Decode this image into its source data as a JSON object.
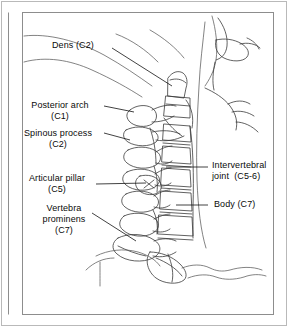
{
  "figure": {
    "background_color": "#ffffff",
    "line_color": "#3a3a3a",
    "frame_color": "#8d8d8d",
    "text_color": "#0a0a0a"
  },
  "labels": {
    "dens": "Dens (C2)",
    "posterior_arch_line1": "Posterior arch",
    "posterior_arch_line2": "(C1)",
    "spinous_process_line1": "Spinous process",
    "spinous_process_line2": "(C2)",
    "articular_pillar_line1": "Articular pillar",
    "articular_pillar_line2": "(C5)",
    "vertebra_prominens_line1": "Vertebra",
    "vertebra_prominens_line2": "prominens",
    "vertebra_prominens_line3": "(C7)",
    "intervertebral_joint_line1": "Intervertebral",
    "intervertebral_joint_line2": "joint  (C5-6)",
    "body_c7": "Body (C7)"
  }
}
